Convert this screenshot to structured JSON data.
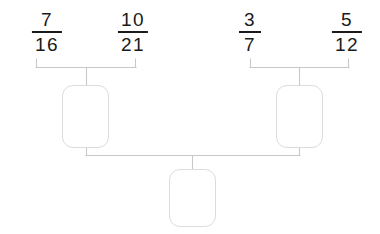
{
  "diagram": {
    "type": "fraction-multiplication-tree",
    "background_color": "#ffffff",
    "line_color": "#c8c8c8",
    "text_color": "#1a1a1a",
    "box_border_color": "#dcdcdc",
    "fractions": [
      {
        "id": "f1",
        "numerator": "7",
        "denominator": "16",
        "label": "7/16"
      },
      {
        "id": "f2",
        "numerator": "10",
        "denominator": "21",
        "label": "10/21"
      },
      {
        "id": "f3",
        "numerator": "3",
        "denominator": "7",
        "label": "3/7"
      },
      {
        "id": "f4",
        "numerator": "5",
        "denominator": "12",
        "label": "5/12"
      }
    ],
    "answer_boxes": [
      {
        "id": "left-box",
        "value": "",
        "placeholder": ""
      },
      {
        "id": "right-box",
        "value": "",
        "placeholder": ""
      },
      {
        "id": "bottom-box",
        "value": "",
        "placeholder": ""
      }
    ]
  }
}
